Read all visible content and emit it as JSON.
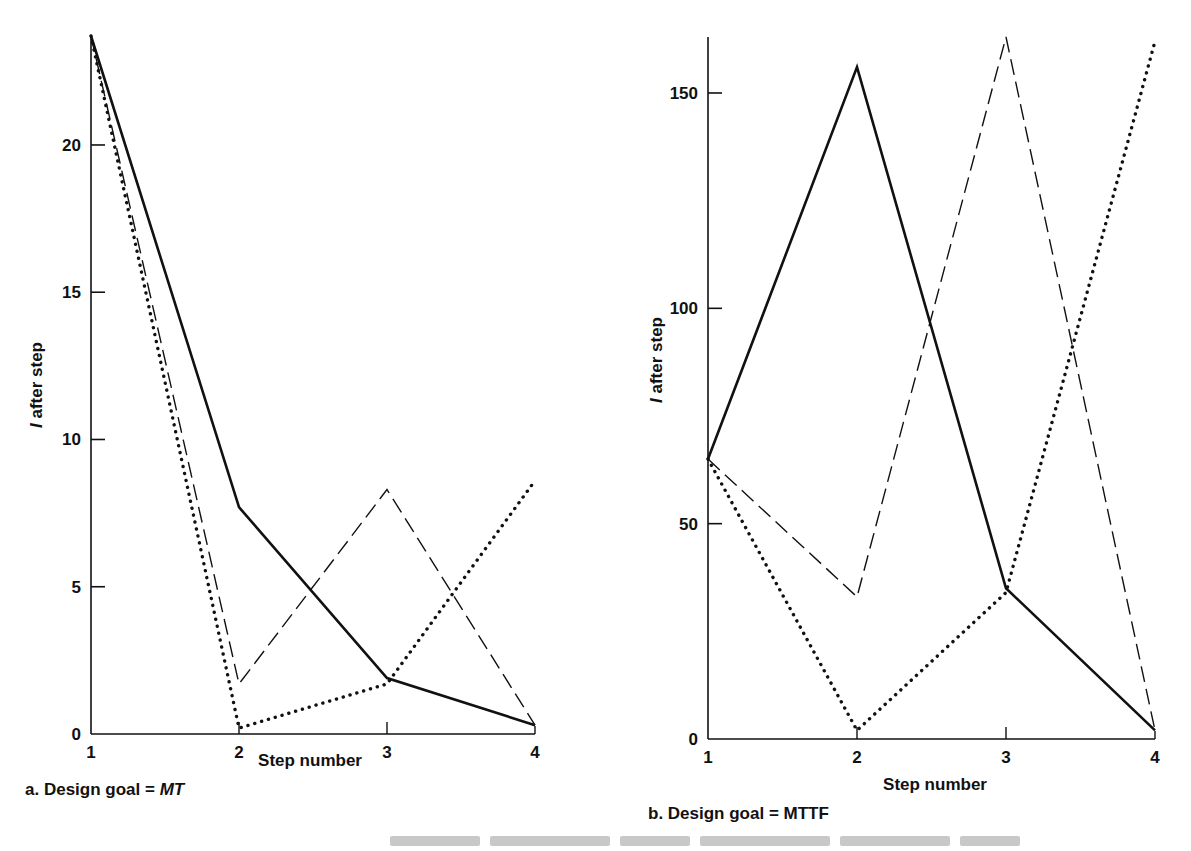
{
  "chart_data": [
    {
      "type": "line",
      "panel": "a",
      "caption_prefix": "a. Design goal = ",
      "caption_goal": "MT",
      "caption_goal_italic": true,
      "xlabel": "Step number",
      "ylabel": "I after step",
      "x": [
        1,
        2,
        3,
        4
      ],
      "xticks": [
        "1",
        "2",
        "3",
        "4"
      ],
      "yticks": [
        0,
        5,
        10,
        15,
        20
      ],
      "ylim": [
        0,
        23.7
      ],
      "grid": false,
      "legend": "none",
      "series": [
        {
          "name": "solid",
          "style": "solid",
          "values": [
            23.7,
            7.7,
            1.9,
            0.3
          ]
        },
        {
          "name": "dashed",
          "style": "dashed",
          "values": [
            23.7,
            1.7,
            8.3,
            0.3
          ]
        },
        {
          "name": "dotted",
          "style": "dotted",
          "values": [
            23.7,
            0.2,
            1.7,
            8.6
          ]
        }
      ]
    },
    {
      "type": "line",
      "panel": "b",
      "caption_prefix": "b. Design goal = ",
      "caption_goal": "MTTF",
      "caption_goal_italic": false,
      "xlabel": "Step number",
      "ylabel": "I after step",
      "x": [
        1,
        2,
        3,
        4
      ],
      "xticks": [
        "1",
        "2",
        "3",
        "4"
      ],
      "yticks": [
        0,
        50,
        100,
        150
      ],
      "ylim": [
        0,
        163
      ],
      "grid": false,
      "legend": "none",
      "series": [
        {
          "name": "solid",
          "style": "solid",
          "values": [
            65,
            156,
            35,
            2
          ]
        },
        {
          "name": "dashed",
          "style": "dashed",
          "values": [
            65,
            33,
            163,
            2
          ]
        },
        {
          "name": "dotted",
          "style": "dotted",
          "values": [
            65,
            2,
            34,
            162
          ]
        }
      ]
    }
  ],
  "layout": {
    "panels": [
      {
        "x0": 91,
        "x1": 535,
        "y0": 734,
        "ytop": 36,
        "caption_x": 25,
        "caption_y": 795,
        "xlabel_x": 310,
        "xlabel_y": 766,
        "ylabel_x": 42,
        "ylabel_y": 385
      },
      {
        "x0": 708,
        "x1": 1155,
        "y0": 739,
        "ytop": 37,
        "caption_x": 648,
        "caption_y": 819,
        "xlabel_x": 935,
        "xlabel_y": 790,
        "ylabel_x": 662,
        "ylabel_y": 360
      }
    ]
  }
}
